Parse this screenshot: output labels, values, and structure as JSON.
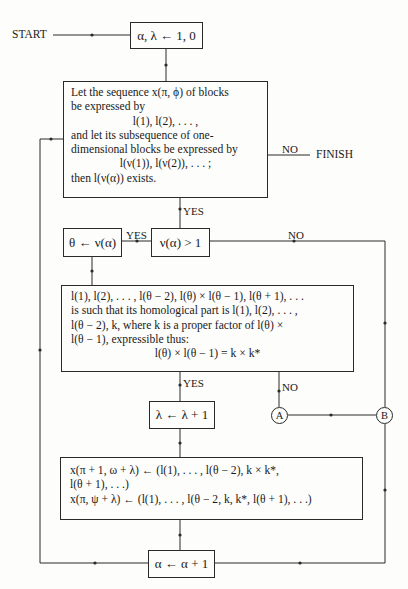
{
  "start_label": "START",
  "finish_label": "FINISH",
  "init_box": "α, λ ← 1, 0",
  "condition_box": {
    "lines": [
      "Let the sequence x(π, ϕ) of blocks",
      "be expressed by",
      "l(1), l(2), . . . ,",
      "and let its subsequence of one-",
      "dimensional blocks be expressed by",
      "l(ν(1)), l(ν(2)), . . . ;",
      "then l(ν(α)) exists."
    ]
  },
  "branch_labels": {
    "condition_no": "NO",
    "condition_yes": "YES",
    "nu_yes": "YES",
    "nu_no": "NO",
    "homology_yes": "YES",
    "homology_no": "NO"
  },
  "nu_test_box": "ν(α) > 1",
  "theta_assign_box": "θ ← ν(α)",
  "homology_box": {
    "lines": [
      "l(1), l(2), . . . , l(θ − 2), l(θ) × l(θ − 1), l(θ + 1), . . .",
      "is such that its homological part is l(1), l(2), . . . ,",
      "l(θ − 2), k, where k is a proper factor of l(θ) ×",
      "l(θ − 1), expressible thus:",
      "l(θ) × l(θ − 1) = k × k*"
    ]
  },
  "lambda_increment_box": "λ ← λ + 1",
  "assignment_box": {
    "lines": [
      "x(π + 1, ω + λ) ← (l(1), . . . , l(θ − 2), k × k*,",
      "l(θ + 1), . . .)",
      "x(π, ψ + λ) ← (l(1), . . . , l(θ − 2, k, k*, l(θ + 1), . . .)"
    ]
  },
  "alpha_increment_box": "α ← α + 1",
  "connectors": {
    "a": "A",
    "b": "B"
  }
}
